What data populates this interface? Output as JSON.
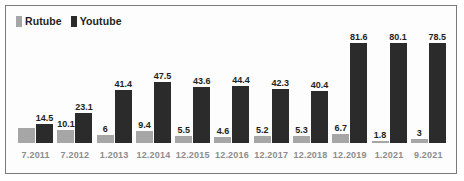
{
  "legend": {
    "items": [
      {
        "label": "Rutube",
        "color": "#a6a6a6",
        "swatch_icon": "square-swatch-icon"
      },
      {
        "label": "Youtube",
        "color": "#2b2b2b",
        "swatch_icon": "square-swatch-icon"
      }
    ]
  },
  "chart_data": {
    "type": "bar",
    "title": "",
    "xlabel": "",
    "ylabel": "",
    "ylim": [
      0,
      90
    ],
    "grid": false,
    "legend_position": "top-left",
    "categories": [
      "7.2011",
      "7.2012",
      "1.2013",
      "12.2014",
      "12.2015",
      "12.2016",
      "12.2017",
      "12.2018",
      "12.2019",
      "1.2021",
      "9.2021"
    ],
    "series": [
      {
        "name": "Rutube",
        "color": "#a6a6a6",
        "values": [
          12,
          10.1,
          6,
          9.4,
          5.5,
          4.6,
          5.2,
          5.3,
          6.7,
          1.8,
          3
        ],
        "labels": [
          "",
          "10.1",
          "6",
          "9.4",
          "5.5",
          "4.6",
          "5.2",
          "5.3",
          "6.7",
          "1.8",
          "3"
        ]
      },
      {
        "name": "Youtube",
        "color": "#2b2b2b",
        "values": [
          14.5,
          23.1,
          41.4,
          47.5,
          43.6,
          44.4,
          42.3,
          40.4,
          81.6,
          80.1,
          78.5
        ],
        "labels": [
          "14.5",
          "23.1",
          "41.4",
          "47.5",
          "43.6",
          "44.4",
          "42.3",
          "40.4",
          "81.6",
          "80.1",
          "78.5"
        ]
      }
    ]
  }
}
